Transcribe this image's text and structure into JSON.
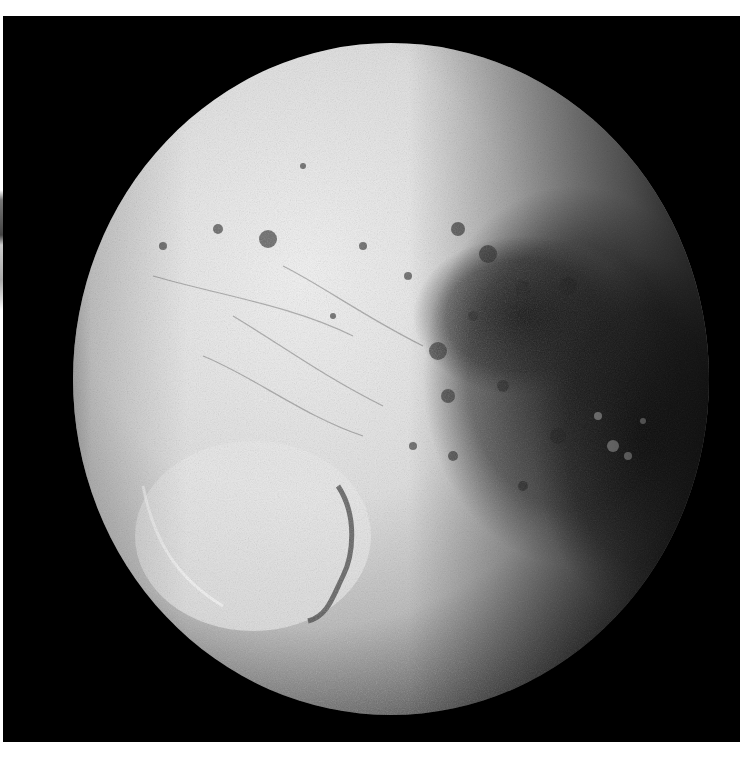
{
  "image": {
    "subject": "Cratered moon in space",
    "description": "Grayscale photograph of a heavily cratered moon against black space; bright left/upper hemisphere with a large impact basin at lower left, dark terrain and shadow on the right limb",
    "colors": {
      "background": "#000000",
      "surface_bright": "#e6e6e6",
      "surface_mid": "#9a9a9a",
      "surface_dark": "#2a2a2a",
      "page_margin": "#ffffff"
    }
  }
}
